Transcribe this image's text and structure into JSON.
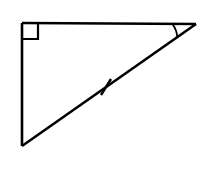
{
  "figure": {
    "name": "right-triangle-with-angle-arc-and-tick",
    "type": "geometry-diagram",
    "canvas": {
      "width": 209,
      "height": 169,
      "background_color": "#ffffff"
    },
    "style": {
      "stroke_color": "#000000",
      "stroke_width": 2.6,
      "marker_stroke_width": 2.2,
      "arc_stroke_width": 1.8,
      "tick_stroke_width": 2.4
    },
    "vertices": {
      "top_left": {
        "label": "right-angle-vertex",
        "x": 22,
        "y": 23
      },
      "top_right": {
        "label": "marked-angle-vertex",
        "x": 196,
        "y": 24
      },
      "bottom_left": {
        "label": "lower-vertex",
        "x": 22,
        "y": 146
      }
    },
    "sides": [
      {
        "name": "top-horizontal-leg",
        "from": "top_left",
        "to": "top_right",
        "x1": 22,
        "y1": 23,
        "x2": 196,
        "y2": 24
      },
      {
        "name": "left-vertical-leg",
        "from": "top_left",
        "to": "bottom_left",
        "x1": 22,
        "y1": 23,
        "x2": 22,
        "y2": 146
      },
      {
        "name": "hypotenuse",
        "from": "bottom_left",
        "to": "top_right",
        "x1": 22,
        "y1": 146,
        "x2": 196,
        "y2": 24
      }
    ],
    "right_angle_marker": {
      "name": "right-angle-square",
      "vertex": "top_left",
      "size": 16,
      "path": "M 22 39 L 38 39 L 38 23"
    },
    "angle_arc": {
      "name": "angle-arc",
      "vertex": "top_right",
      "radius": 24,
      "path": "M 172.2 23.8 A 24 24 0 0 1 177.3 38.3"
    },
    "tick_marks": [
      {
        "name": "hypotenuse-congruence-tick",
        "on_side": "hypotenuse",
        "center_x": 106,
        "center_y": 87,
        "x1": 101,
        "y1": 95,
        "x2": 111,
        "y2": 79
      }
    ]
  }
}
